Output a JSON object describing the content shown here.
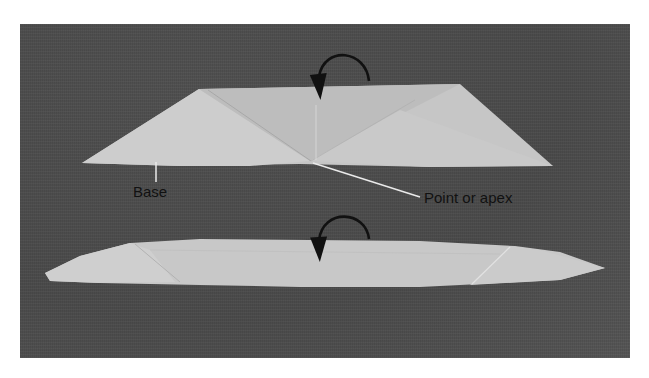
{
  "figure": {
    "labels": {
      "base": "Base",
      "apex": "Point or apex"
    },
    "arrows": [
      {
        "name": "fold-arrow-top",
        "direction": "curved-down-left"
      },
      {
        "name": "fold-arrow-bottom",
        "direction": "curved-down-left"
      }
    ],
    "colors": {
      "background": "#4f4f4f",
      "fabric": "#c9c9c9",
      "fabric_shadow": "#b3b3b3",
      "arrow": "#111111",
      "leader_line": "#e8e8e8"
    }
  }
}
